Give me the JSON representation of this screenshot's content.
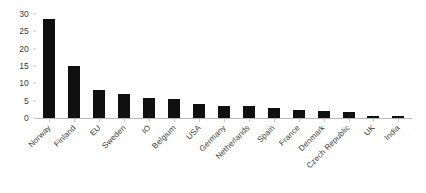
{
  "chart_data": {
    "type": "bar",
    "title": "",
    "xlabel": "",
    "ylabel": "",
    "ylim": [
      0,
      30
    ],
    "yticks": [
      0,
      5,
      10,
      15,
      20,
      25,
      30
    ],
    "grid": false,
    "legend": false,
    "bar_color": "#101010",
    "background_color": "#ffffff",
    "categories": [
      "Norway",
      "Finland",
      "EU",
      "Sweden",
      "IO",
      "Belgium",
      "USA",
      "Germany",
      "Netherlands",
      "Spain",
      "France",
      "Denmark",
      "Czech Republic",
      "UK",
      "India"
    ],
    "values": [
      28.5,
      15,
      8,
      7,
      5.8,
      5.5,
      4,
      3.6,
      3.4,
      2.8,
      2.4,
      2.1,
      1.8,
      0.7,
      0.7
    ]
  }
}
